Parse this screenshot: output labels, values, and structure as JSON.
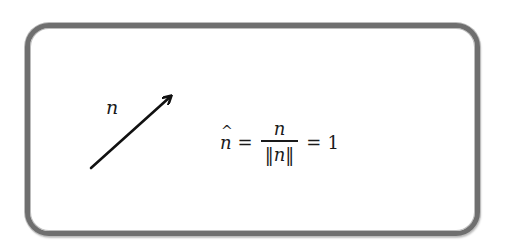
{
  "diagram": {
    "type": "unit-vector-normalization",
    "frame": {
      "border_color": "#6f6f6f",
      "background": "#ffffff"
    },
    "vector": {
      "label": "n",
      "start": [
        91,
        168
      ],
      "end": [
        172,
        95
      ],
      "color": "#111111"
    },
    "equation": {
      "lhs_var": "n",
      "lhs_hat": "^",
      "equals_1": "=",
      "fraction": {
        "numerator": "n",
        "denominator_open": "‖",
        "denominator_var": "n",
        "denominator_close": "‖"
      },
      "equals_2": "=",
      "rhs": "1"
    }
  }
}
